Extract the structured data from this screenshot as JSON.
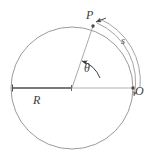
{
  "figure": {
    "background_color": "#ffffff",
    "stroke_color": "#8a8a8a",
    "accent_stroke_color": "#555555",
    "label_color": "#3c3c3c",
    "circle": {
      "center_x": 72,
      "center_y": 88,
      "radius": 61
    },
    "points": [
      {
        "name": "P",
        "x": 93,
        "y": 26
      },
      {
        "name": "O",
        "x": 133,
        "y": 88
      },
      {
        "name": "center",
        "x": 72,
        "y": 88
      }
    ],
    "labels": {
      "point_p": "P",
      "arc_s": "s",
      "point_o": "O",
      "angle_theta": "θ",
      "radius_r": "R"
    }
  }
}
